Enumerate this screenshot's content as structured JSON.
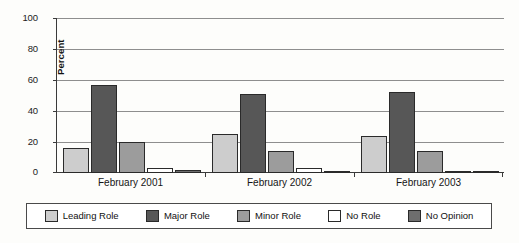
{
  "chart_data": {
    "type": "bar",
    "title": "",
    "xlabel": "",
    "ylabel": "Percent",
    "ylim": [
      0,
      100
    ],
    "yticks": [
      0,
      20,
      40,
      60,
      80,
      100
    ],
    "grid": true,
    "legend_position": "bottom",
    "categories": [
      "February 2001",
      "February 2002",
      "February 2003"
    ],
    "series": [
      {
        "name": "Leading Role",
        "color": "#cdcdcd",
        "values": [
          16,
          25,
          24
        ]
      },
      {
        "name": "Major Role",
        "color": "#575757",
        "values": [
          57,
          51,
          52
        ]
      },
      {
        "name": "Minor Role",
        "color": "#9c9c9c",
        "values": [
          20,
          14,
          14
        ]
      },
      {
        "name": "No Role",
        "color": "#ffffff",
        "values": [
          3,
          3,
          1
        ]
      },
      {
        "name": "No Opinion",
        "color": "#6e6e6e",
        "values": [
          2,
          1,
          1
        ]
      }
    ]
  },
  "axis": {
    "y_title": "Percent",
    "y_tick_labels": [
      "100",
      "80",
      "60",
      "40",
      "20",
      "0"
    ],
    "x_tick_labels": [
      "February 2001",
      "February 2002",
      "February 2003"
    ]
  },
  "legend": {
    "items": [
      {
        "label": "Leading Role"
      },
      {
        "label": "Major Role"
      },
      {
        "label": "Minor Role"
      },
      {
        "label": "No Role"
      },
      {
        "label": "No Opinion"
      }
    ]
  }
}
